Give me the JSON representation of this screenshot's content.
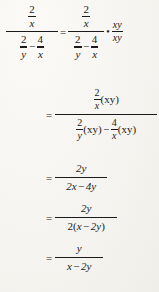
{
  "document": {
    "type": "math-derivation",
    "subject": "simplifying a complex rational expression",
    "background_color": "#f7f6f2",
    "text_color": "#1b1b1b"
  },
  "symbols": {
    "equals": "=",
    "minus": "−",
    "multiply_dot": "•",
    "open_paren": "(",
    "close_paren": ")"
  },
  "steps": [
    {
      "id": "step-1",
      "label": "original expression equals itself times xy over xy",
      "left": {
        "numerator": {
          "num": "2",
          "den": "x"
        },
        "denominator": {
          "term1": {
            "num": "2",
            "den": "y"
          },
          "operator": "−",
          "term2": {
            "num": "4",
            "den": "x"
          }
        }
      },
      "relation": "=",
      "right": {
        "numerator": {
          "num": "2",
          "den": "x"
        },
        "denominator": {
          "term1": {
            "num": "2",
            "den": "y"
          },
          "operator": "−",
          "term2": {
            "num": "4",
            "den": "x"
          }
        }
      },
      "multiplier_symbol": "•",
      "multiplier": {
        "num": "xy",
        "den": "xy"
      }
    },
    {
      "id": "step-2",
      "relation": "=",
      "numerator": {
        "fraction": {
          "num": "2",
          "den": "x"
        },
        "factor": "(xy)"
      },
      "denominator": {
        "term1": {
          "fraction": {
            "num": "2",
            "den": "y"
          },
          "factor": "(xy)"
        },
        "operator": "−",
        "term2": {
          "fraction": {
            "num": "4",
            "den": "x"
          },
          "factor": "(xy)"
        }
      }
    },
    {
      "id": "step-3",
      "relation": "=",
      "numerator": "2y",
      "denominator": "2x − 4y",
      "denominator_parts": {
        "a": "2x",
        "op": "−",
        "b": "4y"
      }
    },
    {
      "id": "step-4",
      "relation": "=",
      "numerator": "2y",
      "denominator": "2(x − 2y)",
      "denominator_parts": {
        "coef": "2",
        "open": "(",
        "a": "x",
        "op": "−",
        "b": "2y",
        "close": ")"
      }
    },
    {
      "id": "step-5",
      "relation": "=",
      "numerator": "y",
      "denominator": "x − 2y",
      "denominator_parts": {
        "a": "x",
        "op": "−",
        "b": "2y"
      }
    }
  ]
}
